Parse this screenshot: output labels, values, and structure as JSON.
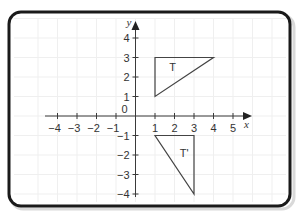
{
  "chart_data": {
    "type": "coordinate-grid",
    "title": "",
    "xlabel": "x",
    "ylabel": "y",
    "xlim": [
      -4,
      5
    ],
    "ylim": [
      -4,
      4
    ],
    "x_ticks": [
      -4,
      -3,
      -2,
      -1,
      1,
      2,
      3,
      4,
      5
    ],
    "y_ticks": [
      4,
      3,
      2,
      1,
      -1,
      -2,
      -3,
      -4
    ],
    "x_tick_labels": [
      "−4",
      "−3",
      "−2",
      "−1",
      "1",
      "2",
      "3",
      "4",
      "5"
    ],
    "y_tick_labels": [
      "4",
      "3",
      "2",
      "1",
      "−1",
      "−2",
      "−3",
      "−4"
    ],
    "origin_label": "0",
    "grid": true,
    "shapes": [
      {
        "name": "T",
        "label": "T",
        "vertices": [
          [
            1,
            1
          ],
          [
            1,
            3
          ],
          [
            4,
            3
          ]
        ],
        "label_at": [
          1.9,
          2.5
        ]
      },
      {
        "name": "T-prime",
        "label": "T'",
        "vertices": [
          [
            1,
            -1
          ],
          [
            3,
            -1
          ],
          [
            3,
            -4
          ]
        ],
        "label_at": [
          2.5,
          -1.9
        ]
      }
    ]
  }
}
